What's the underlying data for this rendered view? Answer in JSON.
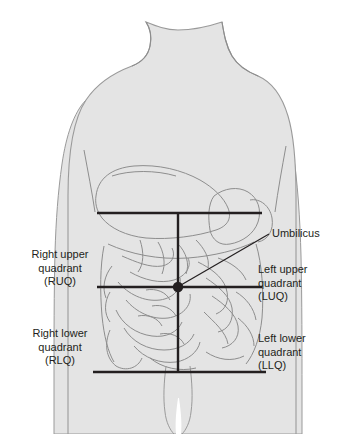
{
  "figure": {
    "body_fill": "#e4e4e4",
    "outline_color": "#8d8d8d",
    "line_color": "#231f20",
    "text_color": "#231f20",
    "background": "#ffffff"
  },
  "labels": {
    "right_upper": "Right upper\nquadrant\n(RUQ)",
    "right_upper_l1": "Right upper",
    "right_upper_l2": "quadrant",
    "right_upper_l3": "(RUQ)",
    "right_lower_l1": "Right lower",
    "right_lower_l2": "quadrant",
    "right_lower_l3": "(RLQ)",
    "left_upper_l1": "Left upper",
    "left_upper_l2": "quadrant",
    "left_upper_l3": "(LUQ)",
    "left_lower_l1": "Left lower",
    "left_lower_l2": "quadrant",
    "left_lower_l3": "(LLQ)",
    "umbilicus": "Umbilicus"
  },
  "markers": {
    "umbilicus_point_x": 178,
    "umbilicus_point_y": 287
  },
  "quadrant_lines": {
    "upper_horizontal_y": 213,
    "middle_horizontal_y": 287,
    "lower_horizontal_y": 372,
    "vertical_x": 178,
    "line_left_x": 97,
    "line_right_x": 262
  }
}
